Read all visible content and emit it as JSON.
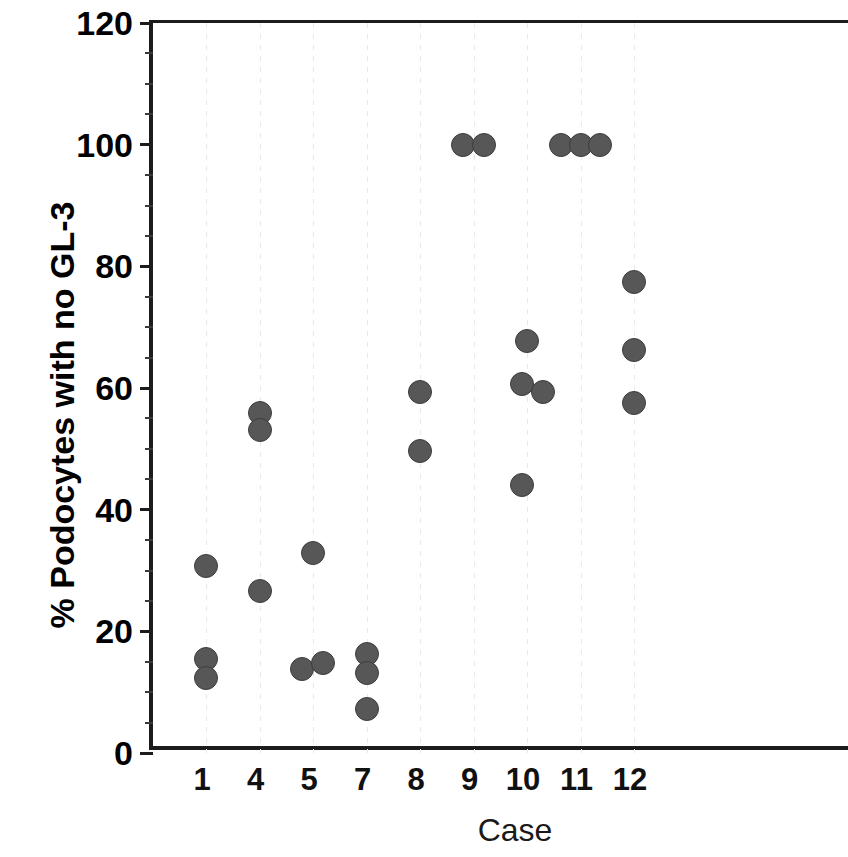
{
  "chart_data": {
    "type": "scatter",
    "title": "",
    "xlabel": "Case",
    "ylabel": "% Podocytes with no GL-3",
    "xlim": [
      0,
      10
    ],
    "ylim": [
      0,
      120
    ],
    "yticks": [
      0,
      20,
      40,
      60,
      80,
      100,
      120
    ],
    "ytick_labels": [
      "0",
      "20",
      "40",
      "60",
      "80",
      "100",
      "120"
    ],
    "y_minor_tick_interval": 5,
    "categories": [
      "1",
      "4",
      "5",
      "7",
      "8",
      "9",
      "10",
      "11",
      "12"
    ],
    "grid": "vertical-dotted-light",
    "legend": "none",
    "marker_color": "#575757",
    "marker_edge_color": "#3d3d3d",
    "axis_color": "#1c1c1c",
    "series": [
      {
        "name": "% Podocytes with no GL-3",
        "points": [
          {
            "case": "1",
            "value": 30.8,
            "jitter": 0
          },
          {
            "case": "1",
            "value": 15.4,
            "jitter": 0
          },
          {
            "case": "1",
            "value": 12.3,
            "jitter": 0
          },
          {
            "case": "4",
            "value": 55.9,
            "jitter": 0
          },
          {
            "case": "4",
            "value": 53.1,
            "jitter": 0
          },
          {
            "case": "4",
            "value": 26.6,
            "jitter": 0
          },
          {
            "case": "5",
            "value": 32.9,
            "jitter": 0
          },
          {
            "case": "5",
            "value": 13.8,
            "jitter": -11
          },
          {
            "case": "5",
            "value": 14.8,
            "jitter": 10
          },
          {
            "case": "7",
            "value": 16.2,
            "jitter": 0
          },
          {
            "case": "7",
            "value": 13.1,
            "jitter": 0
          },
          {
            "case": "7",
            "value": 7.2,
            "jitter": 0
          },
          {
            "case": "8",
            "value": 59.4,
            "jitter": 0
          },
          {
            "case": "8",
            "value": 49.7,
            "jitter": 0
          },
          {
            "case": "9",
            "value": 100,
            "jitter": -11
          },
          {
            "case": "9",
            "value": 100,
            "jitter": 10
          },
          {
            "case": "10",
            "value": 67.8,
            "jitter": 0
          },
          {
            "case": "10",
            "value": 60.6,
            "jitter": -5
          },
          {
            "case": "10",
            "value": 59.3,
            "jitter": 16
          },
          {
            "case": "10",
            "value": 44.0,
            "jitter": -5
          },
          {
            "case": "11",
            "value": 100,
            "jitter": -20
          },
          {
            "case": "11",
            "value": 100,
            "jitter": 0
          },
          {
            "case": "11",
            "value": 100,
            "jitter": 19
          },
          {
            "case": "12",
            "value": 77.5,
            "jitter": 0
          },
          {
            "case": "12",
            "value": 66.3,
            "jitter": 0
          },
          {
            "case": "12",
            "value": 57.5,
            "jitter": 0
          }
        ]
      }
    ]
  }
}
